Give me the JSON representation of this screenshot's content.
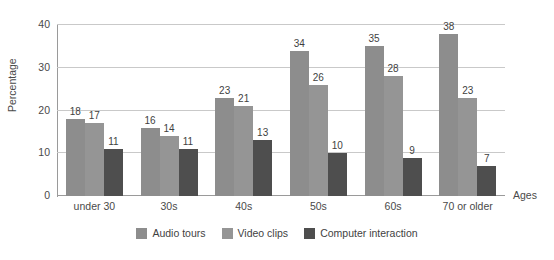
{
  "chart_data": {
    "type": "bar",
    "title": "",
    "xlabel": "Ages",
    "ylabel": "Percentage",
    "ylim": [
      0,
      40
    ],
    "yticks": [
      0,
      10,
      20,
      30,
      40
    ],
    "grid": true,
    "legend_position": "bottom",
    "categories": [
      "under 30",
      "30s",
      "40s",
      "50s",
      "60s",
      "70 or older"
    ],
    "series": [
      {
        "name": "Audio tours",
        "color": "#8d8d8d",
        "values": [
          18,
          16,
          23,
          34,
          35,
          38
        ]
      },
      {
        "name": "Video clips",
        "color": "#959595",
        "values": [
          17,
          14,
          21,
          26,
          28,
          23
        ]
      },
      {
        "name": "Computer interaction",
        "color": "#4e4e4e",
        "values": [
          11,
          11,
          13,
          10,
          9,
          7
        ]
      }
    ]
  },
  "axes": {
    "y_title": "Percentage",
    "x_title": "Ages",
    "y_tick_labels": [
      "0",
      "10",
      "20",
      "30",
      "40"
    ],
    "x_tick_labels": [
      "under 30",
      "30s",
      "40s",
      "50s",
      "60s",
      "70 or older"
    ]
  },
  "legend": {
    "items": [
      {
        "label": "Audio tours",
        "color": "#8d8d8d"
      },
      {
        "label": "Video clips",
        "color": "#959595"
      },
      {
        "label": "Computer interaction",
        "color": "#4e4e4e"
      }
    ]
  },
  "colors": {
    "gridline": "#c9c9c9",
    "axis": "#9a9a9a",
    "text": "#4a4a4a",
    "background": "#ffffff"
  }
}
